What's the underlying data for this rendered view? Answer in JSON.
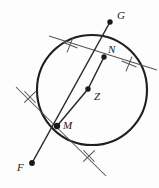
{
  "figure": {
    "kind": "geometry-construction",
    "width": 159,
    "height": 188,
    "background_color": "#fdfdfd",
    "ink_color": "#2b2b2b",
    "circle_color": "#1f1f1f",
    "construction_color": "#555555"
  },
  "labels": {
    "g": "G",
    "n": "N",
    "z": "Z",
    "m": "M",
    "f": "F"
  },
  "points": {
    "G": {
      "label": "G",
      "x": 110,
      "y": 22,
      "label_x": 117,
      "label_y": 10
    },
    "N": {
      "label": "N",
      "x": 104,
      "y": 57,
      "label_x": 108,
      "label_y": 44
    },
    "Z": {
      "label": "Z",
      "x": 88,
      "y": 89,
      "label_x": 94,
      "label_y": 91
    },
    "M": {
      "label": "M",
      "x": 57,
      "y": 126,
      "label_x": 63,
      "label_y": 120
    },
    "F": {
      "label": "F",
      "x": 32,
      "y": 163,
      "label_x": 17,
      "label_y": 162
    }
  },
  "circle": {
    "center_x": 92,
    "center_y": 90,
    "radius": 55,
    "stroke_width": 2.1
  },
  "segments": [
    {
      "name": "radius-ZN",
      "x1": 88,
      "y1": 89,
      "x2": 104,
      "y2": 57
    },
    {
      "name": "radius-ZM",
      "x1": 88,
      "y1": 89,
      "x2": 57,
      "y2": 126
    },
    {
      "name": "line-FG-through-M-N",
      "x1": 32,
      "y1": 163,
      "x2": 110,
      "y2": 22
    }
  ],
  "construction_lines": [
    {
      "name": "tangent-at-N",
      "x1": 49,
      "y1": 36,
      "x2": 157,
      "y2": 70
    },
    {
      "name": "tangent-at-M",
      "x1": 16,
      "y1": 87,
      "x2": 106,
      "y2": 176
    }
  ],
  "tick_marks": [
    {
      "name": "tick-upper-left-of-N",
      "x": 70,
      "y": 45,
      "angle": 22
    },
    {
      "name": "tick-right-of-N",
      "x": 129,
      "y": 64,
      "angle": 22
    },
    {
      "name": "tick-upper-left-of-M",
      "x": 30,
      "y": 97,
      "angle": -44
    },
    {
      "name": "tick-lower-right-of-M",
      "x": 89,
      "y": 156,
      "angle": -44
    }
  ],
  "notes": {
    "center_label": "Z",
    "tangency_points": "M, N",
    "external_points": "F, G"
  }
}
